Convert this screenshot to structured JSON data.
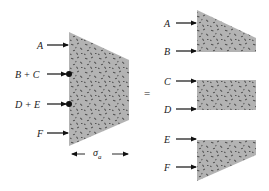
{
  "diagram": {
    "type": "stress-distribution-decomposition",
    "equals_sign": "=",
    "colors": {
      "fill": "#b3b3b3",
      "speckle": "#4d4d4d",
      "arrow": "#111111",
      "text": "#1a1a1a"
    },
    "left_figure": {
      "labels": [
        "A",
        "B + C",
        "D + E",
        "F"
      ],
      "dimension_label": "σ",
      "dimension_subscript": "a"
    },
    "right_figures": [
      {
        "labels": [
          "A",
          "B"
        ],
        "shape": "trapezoid-tapering-down"
      },
      {
        "labels": [
          "C",
          "D"
        ],
        "shape": "rectangle"
      },
      {
        "labels": [
          "E",
          "F"
        ],
        "shape": "trapezoid-tapering-up"
      }
    ]
  }
}
